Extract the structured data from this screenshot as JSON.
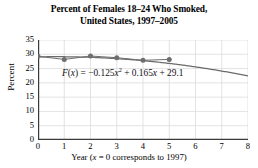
{
  "title": {
    "line1": "Percent of Females 18–24 Who Smoked,",
    "line2": "United States, 1997–2005"
  },
  "axes": {
    "ylabel": "Percent",
    "xlabel": "Year (x = 0 corresponds to 1997)",
    "xlabel_prefix": "Year (",
    "xlabel_var": "x",
    "xlabel_suffix": " = 0 corresponds to 1997)"
  },
  "equation": {
    "full": "F(x) = −0.125x² + 0.165x + 29.1",
    "fn": "F",
    "var": "x",
    "coef_quadratic": -0.125,
    "coef_linear": 0.165,
    "constant": 29.1
  },
  "colors": {
    "curve": "#6b6b6b",
    "point": "#6e6e6e",
    "axis": "#3a3a3a",
    "grid": "#dcdcdc",
    "text": "#000000",
    "background": "#ffffff"
  },
  "chart_data": {
    "type": "scatter",
    "title": "Percent of Females 18–24 Who Smoked, United States, 1997–2005",
    "xlabel": "Year (x = 0 corresponds to 1997)",
    "ylabel": "Percent",
    "xlim": [
      0,
      8
    ],
    "ylim": [
      0,
      35
    ],
    "xticks": [
      0,
      1,
      2,
      3,
      4,
      5,
      6,
      7,
      8
    ],
    "yticks": [
      0,
      5,
      10,
      15,
      20,
      25,
      30,
      35
    ],
    "grid": true,
    "legend": null,
    "x": [
      0,
      1,
      2,
      3,
      4,
      5
    ],
    "values": [
      29.3,
      28.2,
      29.4,
      28.8,
      27.9,
      28.2
    ],
    "series": [
      {
        "name": "Percent of females 18–24 who smoked",
        "type": "scatter",
        "x": [
          0,
          1,
          2,
          3,
          4,
          5
        ],
        "values": [
          29.3,
          28.2,
          29.4,
          28.8,
          27.9,
          28.2
        ]
      },
      {
        "name": "F(x) = −0.125x² + 0.165x + 29.1",
        "type": "line",
        "model": "quadratic",
        "a": -0.125,
        "b": 0.165,
        "c": 29.1,
        "x_range": [
          0,
          8
        ]
      }
    ],
    "annotations": [
      {
        "text": "F(x) = −0.125x² + 0.165x + 29.1",
        "x": 2.2,
        "y": 22.5
      }
    ]
  }
}
